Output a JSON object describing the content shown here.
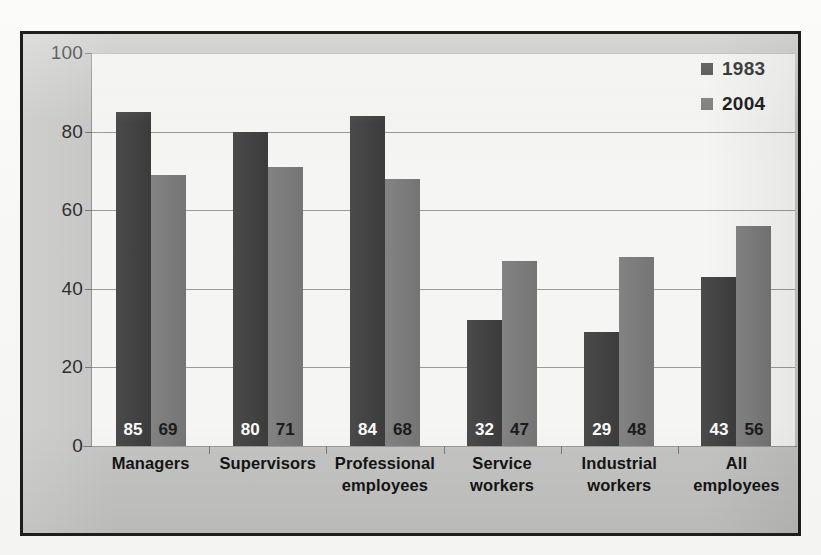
{
  "chart_data": {
    "type": "bar",
    "title": "",
    "subtitle": "",
    "xlabel": "",
    "ylabel": "",
    "ylim": [
      0,
      100
    ],
    "yticks": [
      0,
      20,
      40,
      60,
      80,
      100
    ],
    "ytick_labels": [
      "0",
      "20",
      "40",
      "60",
      "80",
      "100"
    ],
    "grid": "horizontal",
    "legend_position": "top-right",
    "categories": [
      "Managers",
      "Supervisors",
      "Professional employees",
      "Service workers",
      "Industrial workers",
      "All employees"
    ],
    "category_lines": [
      [
        "Managers"
      ],
      [
        "Supervisors"
      ],
      [
        "Professional",
        "employees"
      ],
      [
        "Service",
        "workers"
      ],
      [
        "Industrial",
        "workers"
      ],
      [
        "All",
        "employees"
      ]
    ],
    "series": [
      {
        "name": "1983",
        "color": "#3f3f3f",
        "values": [
          85,
          80,
          84,
          32,
          29,
          43
        ],
        "labels": [
          "85",
          "80",
          "84",
          "32",
          "29",
          "43"
        ]
      },
      {
        "name": "2004",
        "color": "#7b7b7b",
        "values": [
          69,
          71,
          68,
          47,
          48,
          56
        ],
        "labels": [
          "69",
          "71",
          "68",
          "47",
          "48",
          "56"
        ]
      }
    ]
  },
  "legend": {
    "entries": [
      {
        "label": "1983",
        "swatch": "legend-swatch-1983"
      },
      {
        "label": "2004",
        "swatch": "legend-swatch-2004"
      }
    ]
  },
  "colors": {
    "series_1983": "#3f3f3f",
    "series_2004": "#7b7b7b",
    "plot_background": "#f5f5f3",
    "board_background": "#c4c4c2",
    "frame_border": "#1d1d1d",
    "gridline": "#9a9a98",
    "axis_text": "#191919"
  }
}
